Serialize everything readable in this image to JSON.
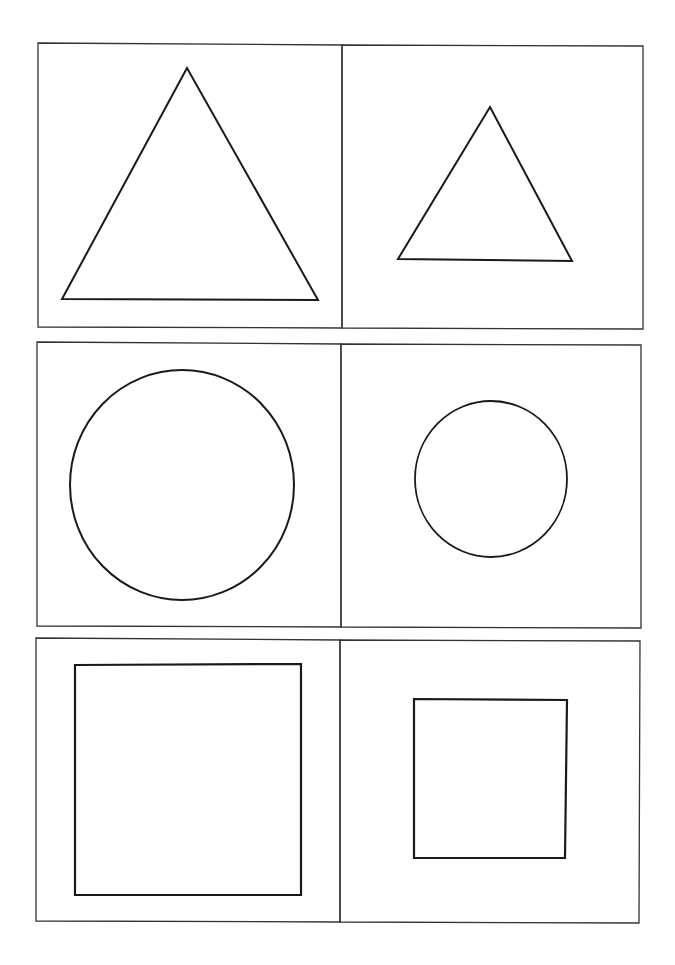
{
  "page": {
    "background": "#ffffff",
    "stroke_color": "#1a1a1a",
    "panel_stroke_color": "#333333"
  },
  "rows": [
    {
      "name": "triangles",
      "panels": [
        {
          "shape": "triangle",
          "size": "large",
          "points": "187,68 62,299 318,300"
        },
        {
          "shape": "triangle",
          "size": "small",
          "points": "490,107 398,259 572,261"
        }
      ]
    },
    {
      "name": "circles",
      "panels": [
        {
          "shape": "circle",
          "size": "large",
          "cx": 182,
          "cy": 485,
          "rx": 112,
          "ry": 115
        },
        {
          "shape": "circle",
          "size": "small",
          "cx": 491,
          "cy": 479,
          "rx": 76,
          "ry": 78
        }
      ]
    },
    {
      "name": "squares",
      "panels": [
        {
          "shape": "square",
          "size": "large",
          "x": 75,
          "y": 664,
          "w": 226,
          "h": 231
        },
        {
          "shape": "square",
          "size": "small",
          "x": 414,
          "y": 699,
          "w": 153,
          "h": 159
        }
      ]
    }
  ]
}
